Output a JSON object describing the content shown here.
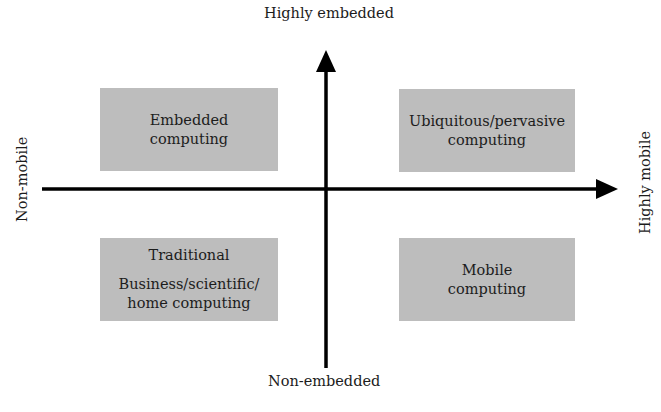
{
  "diagram": {
    "type": "quadrant",
    "axes": {
      "vertical": {
        "top_label": "Highly embedded",
        "bottom_label": "Non-embedded"
      },
      "horizontal": {
        "left_label": "Non-mobile",
        "right_label": "Highly mobile"
      }
    },
    "quadrants": {
      "top_left": {
        "lines": [
          "Embedded",
          "computing"
        ]
      },
      "top_right": {
        "lines": [
          "Ubiquitous/pervasive",
          "computing"
        ]
      },
      "bottom_left": {
        "title": "Traditional",
        "lines": [
          "Business/scientific/",
          "home computing"
        ]
      },
      "bottom_right": {
        "lines": [
          "Mobile",
          "computing"
        ]
      }
    },
    "colors": {
      "box_fill": "#bdbdbd",
      "axis": "#000000",
      "background": "#ffffff"
    }
  }
}
